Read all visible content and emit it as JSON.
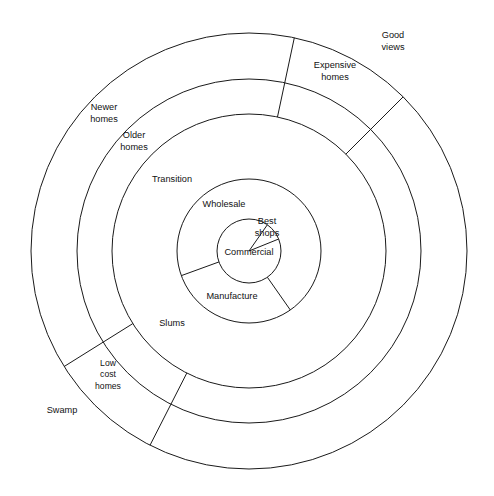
{
  "figure": {
    "background_color": "#ffffff",
    "line_color": "#1a1a1a"
  },
  "chart_data": {
    "type": "pie",
    "xlabel": "",
    "ylabel": "",
    "legend_position": "none",
    "grid": false,
    "center": {
      "x": 249,
      "y": 251
    },
    "ring_radii": [
      32,
      72,
      137,
      172,
      218
    ],
    "rings": [
      {
        "index": 1,
        "name": "core",
        "inner_radius": 0,
        "outer_radius": 32,
        "sectors": [
          {
            "label": "Commercial",
            "start_angle_deg": 55,
            "end_angle_deg": 270
          },
          {
            "label": "Best shops",
            "start_angle_deg": 22,
            "end_angle_deg": 55
          }
        ]
      },
      {
        "index": 2,
        "name": "inner-ring",
        "inner_radius": 32,
        "outer_radius": 72,
        "sectors": [
          {
            "label": "Wholesale",
            "start_angle_deg": 55,
            "end_angle_deg": 200
          },
          {
            "label": "Manufacture",
            "start_angle_deg": 200,
            "end_angle_deg": 305
          }
        ]
      },
      {
        "index": 3,
        "name": "zone-of-transition",
        "inner_radius": 72,
        "outer_radius": 137,
        "sectors": [
          {
            "label": "Transition",
            "start_angle_deg": 0,
            "end_angle_deg": 360
          },
          {
            "label": "Slums",
            "start_angle_deg": 0,
            "end_angle_deg": 360
          }
        ]
      },
      {
        "index": 4,
        "name": "older-homes-ring",
        "inner_radius": 137,
        "outer_radius": 172,
        "sectors": [
          {
            "label": "Older homes",
            "start_angle_deg": 0,
            "end_angle_deg": 360
          }
        ]
      },
      {
        "index": 5,
        "name": "outer-ring",
        "inner_radius": 172,
        "outer_radius": 218,
        "sectors": [
          {
            "label": "Newer homes",
            "start_angle_deg": 0,
            "end_angle_deg": 360
          }
        ]
      }
    ],
    "labels": [
      {
        "id": "good-views",
        "text": "Good views",
        "lines": [
          "Good",
          "views"
        ],
        "x": 393,
        "y": 42,
        "ring": 5
      },
      {
        "id": "expensive-homes",
        "text": "Expensive homes",
        "lines": [
          "Expensive",
          "homes"
        ],
        "x": 335,
        "y": 72,
        "ring": 4
      },
      {
        "id": "newer-homes",
        "text": "Newer homes",
        "lines": [
          "Newer",
          "homes"
        ],
        "x": 104,
        "y": 114,
        "ring": 5
      },
      {
        "id": "older-homes",
        "text": "Older homes",
        "lines": [
          "Older",
          "homes"
        ],
        "x": 134,
        "y": 142,
        "ring": 4
      },
      {
        "id": "transition",
        "text": "Transition",
        "lines": [
          "Transition"
        ],
        "x": 172,
        "y": 180,
        "ring": 3
      },
      {
        "id": "wholesale",
        "text": "Wholesale",
        "lines": [
          "Wholesale"
        ],
        "x": 224,
        "y": 205,
        "ring": 2
      },
      {
        "id": "best-shops",
        "text": "Best shops",
        "lines": [
          "Best",
          "shops"
        ],
        "x": 267,
        "y": 228,
        "ring": 1
      },
      {
        "id": "commercial",
        "text": "Commercial",
        "lines": [
          "Commercial"
        ],
        "x": 249,
        "y": 253,
        "ring": 1
      },
      {
        "id": "manufacture",
        "text": "Manufacture",
        "lines": [
          "Manufacture"
        ],
        "x": 232,
        "y": 297,
        "ring": 2
      },
      {
        "id": "slums",
        "text": "Slums",
        "lines": [
          "Slums"
        ],
        "x": 172,
        "y": 324,
        "ring": 3
      },
      {
        "id": "low-cost-homes",
        "text": "Low cost homes",
        "lines": [
          "Low",
          "cost",
          "homes"
        ],
        "x": 108,
        "y": 375,
        "ring": 4
      },
      {
        "id": "swamp",
        "text": "Swamp",
        "lines": [
          "Swamp"
        ],
        "x": 62,
        "y": 411,
        "ring": 5
      }
    ],
    "radial_dividers": [
      {
        "id": "divider-top",
        "angle_deg": 78,
        "from_radius": 137,
        "to_radius": 218
      },
      {
        "id": "divider-upper-right",
        "angle_deg": 45,
        "from_radius": 137,
        "to_radius": 218
      },
      {
        "id": "divider-lower-left-a",
        "angle_deg": 212,
        "from_radius": 137,
        "to_radius": 218
      },
      {
        "id": "divider-lower-left-b",
        "angle_deg": 243,
        "from_radius": 137,
        "to_radius": 218
      },
      {
        "id": "divider-core-upper",
        "angle_deg": 55,
        "from_radius": 0,
        "to_radius": 32
      },
      {
        "id": "divider-core-right",
        "angle_deg": 22,
        "from_radius": 0,
        "to_radius": 32
      },
      {
        "id": "divider-inner-left",
        "angle_deg": 200,
        "from_radius": 32,
        "to_radius": 72
      },
      {
        "id": "divider-inner-right",
        "angle_deg": 305,
        "from_radius": 32,
        "to_radius": 72
      }
    ]
  }
}
